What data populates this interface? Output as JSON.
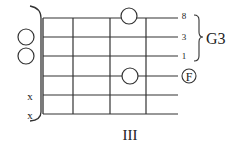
{
  "diagram": {
    "type": "guitar-chord-diagram",
    "fret_position_label": "III",
    "strings": 6,
    "frets_shown": 4,
    "open_strings": [
      2,
      3
    ],
    "muted_strings": [
      5,
      6
    ],
    "muted_marker": "x",
    "fretted_notes": [
      {
        "string": 1,
        "fret": 3
      },
      {
        "string": 4,
        "fret": 3
      }
    ],
    "string_labels": [
      {
        "string": 1,
        "label": "8"
      },
      {
        "string": 2,
        "label": "3"
      },
      {
        "string": 3,
        "label": "1"
      },
      {
        "string": 4,
        "label": "F",
        "circled": true
      }
    ],
    "group_label": "G3",
    "group_strings": [
      1,
      2,
      3
    ],
    "colors": {
      "line": "#333333",
      "background": "#ffffff"
    }
  }
}
